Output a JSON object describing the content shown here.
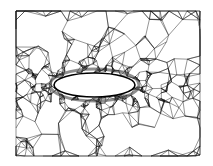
{
  "figure": {
    "background": "#ffffff",
    "line_color": "#111111",
    "body_fill": "#ffffff",
    "body_stroke": "#000000",
    "domain": {
      "x0": 16,
      "y0": 11,
      "x1": 200,
      "y1": 156
    },
    "body": {
      "shape": "ellipse",
      "cx": 94.5,
      "cy": 85,
      "rx": 40.5,
      "ry": 12
    }
  }
}
